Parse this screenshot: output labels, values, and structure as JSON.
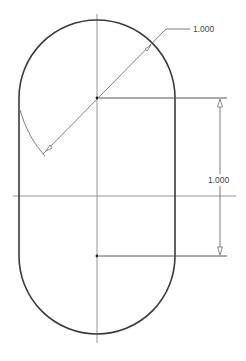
{
  "drawing": {
    "title": "Slot profile with radius and center distance dimensions",
    "colors": {
      "background": "#ffffff",
      "outline": "#3a3a3a",
      "centerline": "#8a8a8a",
      "dimension": "#6e6e6e"
    },
    "shape": {
      "type": "slot",
      "upper_center": [
        97,
        98
      ],
      "lower_center": [
        97,
        256
      ],
      "radius_px": 78
    },
    "dimensions": [
      {
        "id": "radius",
        "kind": "radius-leader",
        "label": "1.000"
      },
      {
        "id": "center-distance",
        "kind": "linear-vertical",
        "label": "1.000"
      }
    ]
  }
}
